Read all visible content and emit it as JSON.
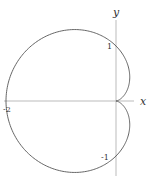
{
  "chart_data": {
    "type": "line",
    "title": "",
    "equation": "r = 1 - cos(theta)",
    "curve": "cardioid",
    "xlabel": "x",
    "ylabel": "y",
    "tick_labels": {
      "x": [
        "-2"
      ],
      "y": [
        "1",
        "-1"
      ]
    },
    "xlim": [
      -2.1,
      0.6
    ],
    "ylim": [
      -1.4,
      1.6
    ],
    "grid": false,
    "legend": null,
    "key_points": [
      {
        "x": -2,
        "y": 0,
        "label": "-2"
      },
      {
        "x": 0,
        "y": 1,
        "label": "1"
      },
      {
        "x": 0,
        "y": -1,
        "label": "-1"
      },
      {
        "x": 0,
        "y": 0,
        "label": "cusp"
      }
    ]
  },
  "axes": {
    "x_label": "x",
    "y_label": "y",
    "tick_neg2": "-2",
    "tick_1": "1",
    "tick_neg1": "-1"
  },
  "colors": {
    "curve": "#555555",
    "axes": "#999999",
    "text": "#333333"
  }
}
